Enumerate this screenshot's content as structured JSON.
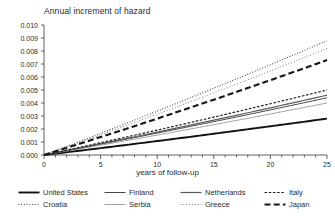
{
  "chart_data": {
    "type": "line",
    "title": "Annual increment of hazard",
    "xlabel": "years of follow-up",
    "ylabel": "",
    "xlim": [
      0,
      25
    ],
    "ylim": [
      0,
      0.01
    ],
    "grid": false,
    "legend_position": "bottom",
    "x_ticks": [
      "0",
      "5",
      "10",
      "15",
      "20",
      "25"
    ],
    "x_tick_values": [
      0,
      5,
      10,
      15,
      20,
      25
    ],
    "x_minor_tick_step": 1,
    "y_ticks": [
      "0.000",
      "0.001",
      "0.002",
      "0.003",
      "0.004",
      "0.005",
      "0.006",
      "0.007",
      "0.008",
      "0.009",
      "0.010"
    ],
    "y_tick_values": [
      0.0,
      0.001,
      0.002,
      0.003,
      0.004,
      0.005,
      0.006,
      0.007,
      0.008,
      0.009,
      0.01
    ],
    "x": [
      0,
      5,
      10,
      15,
      20,
      25
    ],
    "series": [
      {
        "name": "United States",
        "style": "solid-thick",
        "color": "#111111",
        "values": [
          0.0,
          0.00055,
          0.00112,
          0.00168,
          0.00224,
          0.0028
        ]
      },
      {
        "name": "Croatia",
        "style": "dotted-fine",
        "color": "#3a3a3a",
        "values": [
          0.0,
          0.00176,
          0.00352,
          0.00528,
          0.00704,
          0.0088
        ]
      },
      {
        "name": "Finland",
        "style": "solid-thin",
        "color": "#333333",
        "values": [
          0.0,
          0.00088,
          0.00176,
          0.00264,
          0.00352,
          0.0044
        ]
      },
      {
        "name": "Serbia",
        "style": "solid-light",
        "color": "#8c8c8c",
        "values": [
          0.0,
          0.0008,
          0.0016,
          0.0024,
          0.0032,
          0.004
        ]
      },
      {
        "name": "Netherlands",
        "style": "solid-medium",
        "color": "#5a5a5a",
        "values": [
          0.0,
          0.00092,
          0.00184,
          0.00276,
          0.00368,
          0.0046
        ]
      },
      {
        "name": "Greece",
        "style": "dotted-light",
        "color": "#6e6e6e",
        "values": [
          0.0,
          0.00164,
          0.00328,
          0.00492,
          0.00656,
          0.0082
        ]
      },
      {
        "name": "Italy",
        "style": "dash-dot-thin",
        "color": "#222222",
        "values": [
          0.0,
          0.001,
          0.002,
          0.003,
          0.004,
          0.005
        ]
      },
      {
        "name": "Japan",
        "style": "dashed-thick",
        "color": "#161616",
        "values": [
          0.0,
          0.00146,
          0.00292,
          0.00438,
          0.00584,
          0.0073
        ]
      }
    ]
  },
  "legend": {
    "entries": [
      {
        "label": "United States",
        "style": "solid-thick",
        "color": "#111111"
      },
      {
        "label": "Finland",
        "style": "solid-thin",
        "color": "#333333"
      },
      {
        "label": "Netherlands",
        "style": "solid-medium",
        "color": "#5a5a5a"
      },
      {
        "label": "Italy",
        "style": "dash-dot-thin",
        "color": "#222222"
      },
      {
        "label": "Croatia",
        "style": "dotted-fine",
        "color": "#3a3a3a"
      },
      {
        "label": "Serbia",
        "style": "solid-light",
        "color": "#8c8c8c"
      },
      {
        "label": "Greece",
        "style": "dotted-light",
        "color": "#6e6e6e"
      },
      {
        "label": "Japan",
        "style": "dashed-thick",
        "color": "#161616"
      }
    ]
  }
}
